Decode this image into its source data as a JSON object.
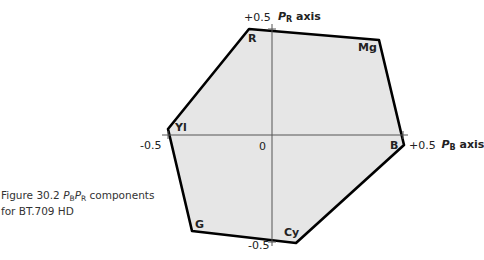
{
  "figure": {
    "caption_prefix": "Figure 30.2",
    "caption_sym_p1": "P",
    "caption_sub_b": "B",
    "caption_sym_p2": "P",
    "caption_sub_r": "R",
    "caption_rest1": " components",
    "caption_line2": "for BT.709 HD"
  },
  "axes": {
    "pr_axis": {
      "sym": "P",
      "sub": "R",
      "word": "axis",
      "pos_tick": "+0.5",
      "neg_tick": "-0.5"
    },
    "pb_axis": {
      "sym": "P",
      "sub": "B",
      "word": "axis",
      "pos_tick": "+0.5",
      "neg_tick": "-0.5"
    },
    "origin": "0"
  },
  "vertices": [
    {
      "label": "R",
      "x": 249,
      "y": 29
    },
    {
      "label": "Mg",
      "x": 379,
      "y": 40
    },
    {
      "label": "B",
      "x": 404,
      "y": 145
    },
    {
      "label": "Cy",
      "x": 296,
      "y": 243
    },
    {
      "label": "G",
      "x": 192,
      "y": 231
    },
    {
      "label": "Yl",
      "x": 168,
      "y": 129
    }
  ],
  "colors": {
    "fill": "#e6e6e6",
    "outline": "#000000",
    "axis": "#555555"
  }
}
